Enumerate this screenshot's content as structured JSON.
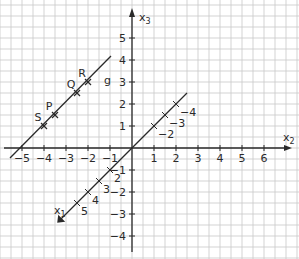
{
  "diagram": {
    "type": "3d-coordinate-system",
    "axes": {
      "x1": {
        "label": "x",
        "sub": "1",
        "ticks": [
          {
            "v": -4,
            "label": "−4"
          },
          {
            "v": -3,
            "label": "−3"
          },
          {
            "v": -2,
            "label": "−2"
          },
          {
            "v": 2,
            "label": "2"
          },
          {
            "v": 3,
            "label": "3"
          },
          {
            "v": 4,
            "label": "4"
          },
          {
            "v": 5,
            "label": "5"
          }
        ]
      },
      "x2": {
        "label": "x",
        "sub": "2",
        "ticks": [
          {
            "v": -5,
            "label": "−5"
          },
          {
            "v": -4,
            "label": "−4"
          },
          {
            "v": -3,
            "label": "−3"
          },
          {
            "v": -2,
            "label": "−2"
          },
          {
            "v": -1,
            "label": "−1"
          },
          {
            "v": 1,
            "label": "1"
          },
          {
            "v": 2,
            "label": "2"
          },
          {
            "v": 3,
            "label": "3"
          },
          {
            "v": 4,
            "label": "4"
          },
          {
            "v": 5,
            "label": "5"
          },
          {
            "v": 6,
            "label": "6"
          }
        ]
      },
      "x3": {
        "label": "x",
        "sub": "3",
        "ticks": [
          {
            "v": -4,
            "label": "−4"
          },
          {
            "v": -3,
            "label": "−3"
          },
          {
            "v": -2,
            "label": "−2"
          },
          {
            "v": -1,
            "label": "−1"
          },
          {
            "v": 1,
            "label": "1"
          },
          {
            "v": 2,
            "label": "2"
          },
          {
            "v": 3,
            "label": "3"
          },
          {
            "v": 4,
            "label": "4"
          },
          {
            "v": 5,
            "label": "5"
          }
        ]
      }
    },
    "line": {
      "label": "g"
    },
    "points": [
      {
        "label": "S",
        "x2": -4,
        "x3": 1
      },
      {
        "label": "P",
        "x2": -3.5,
        "x3": 1.5
      },
      {
        "label": "Q",
        "x2": -2.5,
        "x3": 2.5
      },
      {
        "label": "R",
        "x2": -2,
        "x3": 3
      }
    ],
    "line_g_endpoints": [
      {
        "x2": -5.5,
        "x3": -0.5
      },
      {
        "x2": -1.5,
        "x3": 3.8
      }
    ]
  }
}
